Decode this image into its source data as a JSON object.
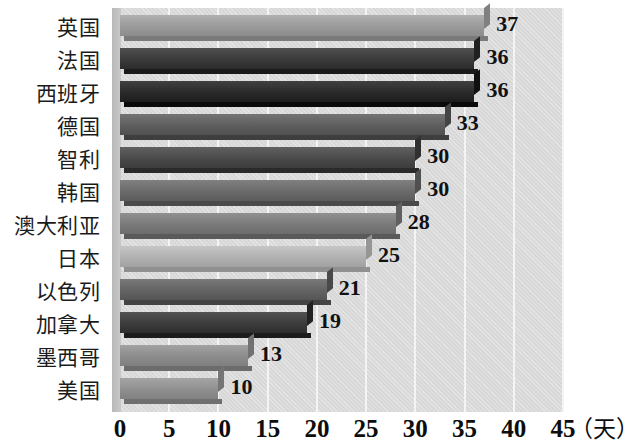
{
  "chart_data": {
    "type": "bar",
    "orientation": "horizontal",
    "title": "",
    "xlabel": "（天）",
    "ylabel": "",
    "xlim": [
      0,
      45
    ],
    "xticks": [
      0,
      5,
      10,
      15,
      20,
      25,
      30,
      35,
      40,
      45
    ],
    "grid": true,
    "legend": false,
    "categories": [
      "英国",
      "法国",
      "西班牙",
      "德国",
      "智利",
      "韩国",
      "澳大利亚",
      "日本",
      "以色列",
      "加拿大",
      "墨西哥",
      "美国"
    ],
    "values": [
      37,
      36,
      36,
      33,
      30,
      30,
      28,
      25,
      21,
      19,
      13,
      10
    ],
    "value_labels": [
      "37",
      "36",
      "36",
      "33",
      "30",
      "30",
      "28",
      "25",
      "21",
      "19",
      "13",
      "10"
    ],
    "bar_colors": [
      "#9a9a9a",
      "#3a3a3a",
      "#2a2a2a",
      "#5e5e5e",
      "#4a4a4a",
      "#6a6a6a",
      "#7a7a7a",
      "#b0b0b0",
      "#636363",
      "#3c3c3c",
      "#8c8c8c",
      "#8f8f8f"
    ],
    "plot_background": "#d8d8d8",
    "gridline_color": "#f4f4f4",
    "text_color": "#111111"
  },
  "axis": {
    "tick_labels": [
      "0",
      "5",
      "10",
      "15",
      "20",
      "25",
      "30",
      "35",
      "40",
      "45"
    ],
    "unit_label": "（天）"
  }
}
